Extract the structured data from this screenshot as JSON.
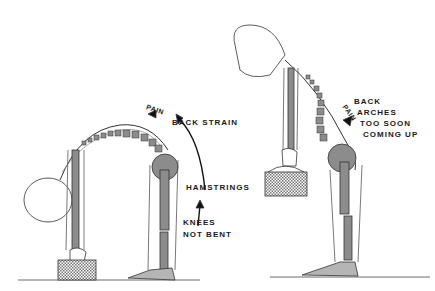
{
  "diagram": {
    "colors": {
      "ink": "#1a1a1a",
      "bone_fill": "#8c8c8c",
      "bone_light": "#b5b5b5",
      "background": "#ffffff"
    },
    "left_figure": {
      "labels": {
        "pain": "PAIN",
        "back_strain": "BACK STRAIN",
        "hamstrings": "HAMSTRINGS",
        "knees_line1": "KNEES",
        "knees_line2": "NOT BENT"
      }
    },
    "right_figure": {
      "labels": {
        "pain": "PAIN",
        "line1": "BACK",
        "line2": "ARCHES",
        "line3": "TOO SOON",
        "line4": "COMING UP"
      }
    }
  }
}
